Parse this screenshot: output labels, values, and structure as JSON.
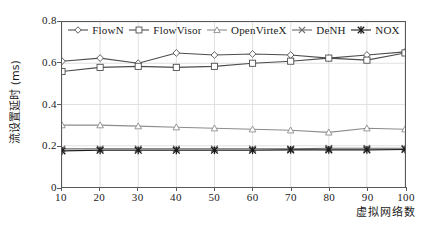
{
  "chart_data": {
    "type": "line",
    "title": "",
    "xlabel": "虚拟网络数",
    "ylabel": "流设置延时 (ms)",
    "xlim": [
      10,
      100
    ],
    "ylim": [
      0,
      0.8
    ],
    "grid": true,
    "legend_position": "top-inside",
    "x": [
      10,
      20,
      30,
      40,
      50,
      60,
      70,
      80,
      90,
      100
    ],
    "xticks": [
      "10",
      "20",
      "30",
      "40",
      "50",
      "60",
      "70",
      "80",
      "90",
      "100"
    ],
    "yticks": [
      "0",
      "0.2",
      "0.4",
      "0.6",
      "0.8"
    ],
    "ytick_values": [
      0,
      0.2,
      0.4,
      0.6,
      0.8
    ],
    "series": [
      {
        "name": "FlowN",
        "marker": "diamond",
        "color": "#4d4d4d",
        "values": [
          0.61,
          0.625,
          0.6,
          0.65,
          0.64,
          0.645,
          0.64,
          0.625,
          0.64,
          0.655
        ]
      },
      {
        "name": "FlowVisor",
        "marker": "square",
        "color": "#4d4d4d",
        "values": [
          0.56,
          0.58,
          0.585,
          0.58,
          0.585,
          0.6,
          0.61,
          0.625,
          0.615,
          0.65
        ]
      },
      {
        "name": "OpenVirteX",
        "marker": "triangle",
        "color": "#8c8c8c",
        "values": [
          0.3,
          0.3,
          0.295,
          0.29,
          0.285,
          0.28,
          0.275,
          0.265,
          0.285,
          0.28
        ]
      },
      {
        "name": "DeNH",
        "marker": "cross",
        "color": "#6b6b6b",
        "values": [
          0.185,
          0.185,
          0.185,
          0.185,
          0.185,
          0.185,
          0.185,
          0.188,
          0.188,
          0.188
        ]
      },
      {
        "name": "NOX",
        "marker": "star",
        "color": "#1a1a1a",
        "values": [
          0.175,
          0.178,
          0.178,
          0.178,
          0.178,
          0.178,
          0.18,
          0.18,
          0.18,
          0.182
        ]
      }
    ]
  }
}
